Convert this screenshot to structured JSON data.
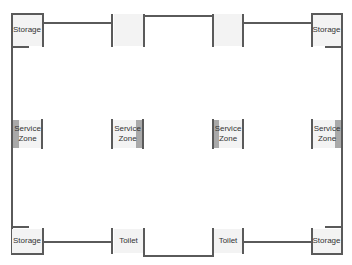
{
  "plan": {
    "rooms": {
      "storage_tl": "Storage",
      "storage_tr": "Storage",
      "storage_bl": "Storage",
      "storage_br": "Storage",
      "service_1_line1": "Service",
      "service_1_line2": "Zone",
      "service_2_line1": "Service",
      "service_2_line2": "Zone",
      "service_3_line1": "Service",
      "service_3_line2": "Zone",
      "service_4_line1": "Service",
      "service_4_line2": "Zone",
      "toilet_1": "Toilet",
      "toilet_2": "Toilet"
    },
    "colors": {
      "wall": "#5a5a5a",
      "room_fill": "#f3f3f3",
      "accent": "#a9a9a9"
    }
  }
}
